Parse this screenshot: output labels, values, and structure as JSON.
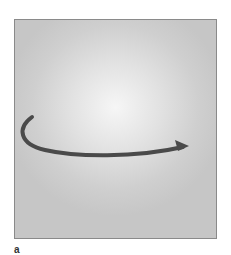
{
  "figure": {
    "panel_label": "a",
    "arrow": {
      "color": "#4a4a4a",
      "direction": "clockwise-rotation-left-to-right"
    },
    "background": {
      "center_color": "#f6f6f6",
      "edge_color": "#c6c6c6",
      "border_color": "#8a8a8a"
    }
  }
}
